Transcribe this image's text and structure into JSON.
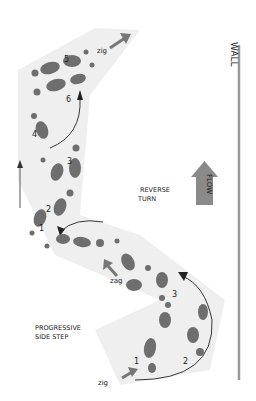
{
  "diagram": {
    "wall_label": "WALL",
    "flow_label": "FLOW",
    "reverse_turn_label": [
      "REVERSE",
      "TURN"
    ],
    "progressive_side_step_label": [
      "PROGRESSIVE",
      "SIDE STEP"
    ],
    "zig_top": "zig",
    "zag_mid": "zag",
    "zig_bottom": "zig",
    "step_numbers_upper": [
      "1",
      "2",
      "3",
      "4",
      "5",
      "6"
    ],
    "step_numbers_lower": [
      "1",
      "2",
      "3"
    ],
    "colors": {
      "floor": "#ececec",
      "footprint": "#6e6e6e",
      "arrow": "#7a7a7a",
      "flow_arrow": "#8a8a8a",
      "wall": "#999999"
    }
  }
}
